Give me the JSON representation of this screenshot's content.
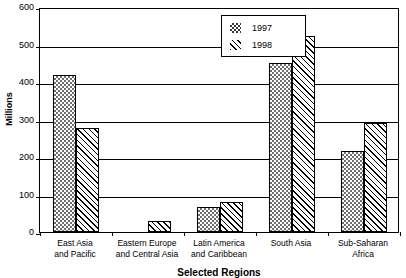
{
  "chart_data": {
    "type": "bar",
    "title": "",
    "xlabel": "Selected Regions",
    "ylabel": "Millions",
    "ylim": [
      0,
      600
    ],
    "yticks": [
      0,
      100,
      200,
      300,
      400,
      500,
      600
    ],
    "ytick_labels": [
      "0",
      "100",
      "200",
      "300",
      "400",
      "500",
      "600"
    ],
    "grid": true,
    "legend_position": "top-center-right",
    "categories": [
      "East Asia and Pacific",
      "Eastern Europe and Central Asia",
      "Latin America and Caribbean",
      "South Asia",
      "Sub-Saharan Africa"
    ],
    "category_lines": [
      [
        "East Asia",
        "and Pacific"
      ],
      [
        "Eastern Europe",
        "and Central Asia"
      ],
      [
        "Latin America",
        "and Caribbean"
      ],
      [
        "South Asia",
        ""
      ],
      [
        "Sub-Saharan",
        "Africa"
      ]
    ],
    "series": [
      {
        "name": "1997",
        "pattern": "dotted-checker",
        "values": [
          418,
          0,
          67,
          450,
          215
        ]
      },
      {
        "name": "1998",
        "pattern": "diagonal-hatch",
        "values": [
          278,
          30,
          80,
          522,
          292
        ]
      }
    ]
  },
  "legend": {
    "items": [
      {
        "label": "1997",
        "pattern": "series-1997"
      },
      {
        "label": "1998",
        "pattern": "series-1998"
      }
    ]
  },
  "colors": {
    "axis": "#000000",
    "grid": "#000000",
    "series_1997_fill": "#6f6f6f",
    "series_1998_fill": "#ffffff",
    "background": "#ffffff"
  }
}
